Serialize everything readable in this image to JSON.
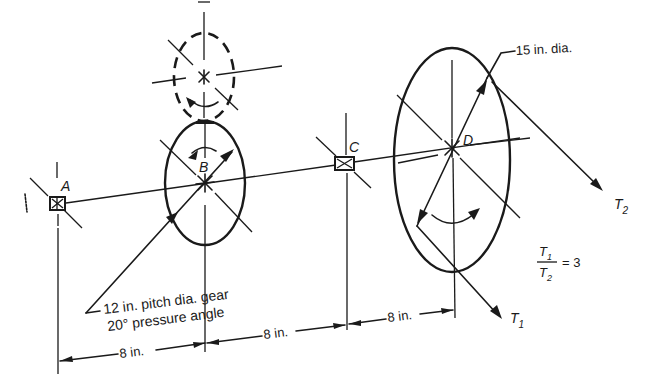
{
  "figure": {
    "labels": {
      "A": "A",
      "B": "B",
      "C": "C",
      "D": "D"
    },
    "gear_label_line1": "12 in. pitch dia. gear",
    "gear_label_line2": "20° pressure angle",
    "pulley_label": "15 in. dia.",
    "tension_T1": "T",
    "tension_T1_sub": "1",
    "tension_T2": "T",
    "tension_T2_sub": "2",
    "ratio": {
      "numerator": "T",
      "numerator_sub": "1",
      "denominator": "T",
      "denominator_sub": "2",
      "equals": "= 3"
    },
    "dimensions": [
      {
        "label": "8 in.",
        "from": "A",
        "to": "B"
      },
      {
        "label": "8 in.",
        "from": "B",
        "to": "C"
      },
      {
        "label": "8 in.",
        "from": "C",
        "to": "D"
      }
    ],
    "line_color": "#1a1a1a"
  }
}
